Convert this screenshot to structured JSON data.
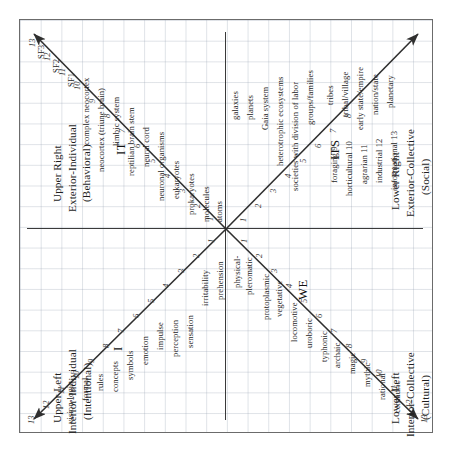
{
  "diagram": {
    "axis": {
      "vertical": "vertical-axis",
      "horizontal": "horizontal-axis"
    },
    "colors": {
      "grid": "#96a2b2",
      "frame": "#6b6b6b",
      "axis": "#3a3a3a",
      "arrow": "#2f2f2f",
      "text": "#262626"
    }
  },
  "quadrants": {
    "upper_right": {
      "title": "Upper Right",
      "subtitle": "Exterior-Individual",
      "parenthetical": "(Behavioral)",
      "pronoun": "IT",
      "numbers": [
        "1",
        "2",
        "3",
        "4",
        "5",
        "6",
        "7",
        "8",
        "9",
        "10",
        "11",
        "12",
        "13"
      ],
      "labels": [
        "atoms",
        "molecules",
        "prokaryotes",
        "eukaryotes",
        "neuronal organisms",
        "neural cord",
        "reptilian brain stem",
        "limbic system",
        "neocortex (triune brain)",
        "complex neocortex",
        "SF1",
        "SF2",
        "SF3"
      ]
    },
    "upper_left": {
      "title": "Upper Left",
      "subtitle": "Interior-Individual",
      "parenthetical": "(Intentional)",
      "pronoun": "I",
      "numbers": [
        "1",
        "2",
        "3",
        "4",
        "5",
        "6",
        "7",
        "8",
        "9",
        "10",
        "11",
        "12",
        "13"
      ],
      "labels": [
        "prehension",
        "irritability",
        "sensation",
        "perception",
        "impulse",
        "emotion",
        "symbols",
        "concepts",
        "rules",
        "formal",
        "vision-logic"
      ]
    },
    "lower_right": {
      "title": "Lower Right",
      "subtitle": "Exterior-Collective",
      "parenthetical": "(Social)",
      "pronoun": "ITS",
      "numbers": [
        "1",
        "2",
        "3",
        "4",
        "5",
        "6",
        "7",
        "8",
        "9",
        "10",
        "11",
        "12",
        "13"
      ],
      "labels": [
        "galaxies",
        "planets",
        "Gaia system",
        "heterotrophic ecosystems",
        "societies with division of labor",
        "groups/families",
        "tribes",
        "foraging 9",
        "horticultural 10",
        "tribal/village",
        "agrarian 11",
        "early state/empire",
        "industrial 12",
        "nation/state",
        "informational 13",
        "planetary"
      ]
    },
    "lower_left": {
      "title": "Lower Left",
      "subtitle": "Interior-Collective",
      "parenthetical": "(Cultural)",
      "pronoun": "WE",
      "numbers": [
        "1",
        "2",
        "3",
        "4",
        "5",
        "6",
        "7",
        "8",
        "9",
        "10",
        "11",
        "12",
        "13"
      ],
      "labels": [
        "physical-",
        "pleromatic",
        "protoplasmic",
        "vegetative",
        "locomotive",
        "uroboric",
        "typhonic",
        "archaic",
        "magic",
        "mythic",
        "rational",
        "centauric"
      ]
    }
  },
  "ur_items": [
    {
      "n": "1",
      "label": "atoms"
    },
    {
      "n": "2",
      "label": "molecules"
    },
    {
      "n": "3",
      "label": "prokaryotes"
    },
    {
      "n": "4",
      "label": "eukaryotes"
    },
    {
      "n": "5",
      "label": "neuronal organisms"
    },
    {
      "n": "6",
      "label": "neural cord"
    },
    {
      "n": "7",
      "label": "reptilian brain stem"
    },
    {
      "n": "8",
      "label": "limbic system"
    },
    {
      "n": "9",
      "label": "neocortex (triune brain)"
    },
    {
      "n": "10",
      "label": "complex neocortex"
    },
    {
      "n": "11",
      "label": "SF1"
    },
    {
      "n": "12",
      "label": "SF2"
    },
    {
      "n": "13",
      "label": "SF3"
    }
  ],
  "ul_items": [
    {
      "n": "1",
      "label": "prehension"
    },
    {
      "n": "2",
      "label": "irritability"
    },
    {
      "n": "3",
      "label": "sensation"
    },
    {
      "n": "4",
      "label": "perception"
    },
    {
      "n": "5",
      "label": "impulse"
    },
    {
      "n": "6",
      "label": "emotion"
    },
    {
      "n": "7",
      "label": "symbols"
    },
    {
      "n": "8",
      "label": "concepts"
    },
    {
      "n": "9",
      "label": "rules"
    },
    {
      "n": "10",
      "label": "formal"
    },
    {
      "n": "11",
      "label": "vision-logic"
    }
  ],
  "lr_items": [
    {
      "n": "1",
      "label": "galaxies"
    },
    {
      "n": "2",
      "label": "planets"
    },
    {
      "n": "3",
      "label": "Gaia system"
    },
    {
      "n": "4",
      "label": "heterotrophic ecosystems"
    },
    {
      "n": "5",
      "label": "societies with division of labor"
    },
    {
      "n": "6",
      "label": "groups/families"
    },
    {
      "n": "7",
      "label": "tribes"
    },
    {
      "n": "8",
      "label": "tribal/village"
    },
    {
      "n": "9",
      "label": "early state/empire"
    },
    {
      "n": "10",
      "label": "nation/state"
    },
    {
      "n": "11",
      "label": "planetary"
    }
  ],
  "lr_stage_items": [
    {
      "label": "foraging 9"
    },
    {
      "label": "horticultural 10"
    },
    {
      "label": "agrarian 11"
    },
    {
      "label": "industrial 12"
    },
    {
      "label": "informational 13"
    }
  ],
  "ll_items": [
    {
      "n": "1",
      "label": "physical-"
    },
    {
      "n": "1b",
      "label": "pleromatic"
    },
    {
      "n": "2",
      "label": "protoplasmic"
    },
    {
      "n": "3",
      "label": "vegetative"
    },
    {
      "n": "4",
      "label": "locomotive"
    },
    {
      "n": "5",
      "label": "uroboric"
    },
    {
      "n": "6",
      "label": "typhonic"
    },
    {
      "n": "7",
      "label": "archaic"
    },
    {
      "n": "8",
      "label": "magic"
    },
    {
      "n": "9",
      "label": "mythic"
    },
    {
      "n": "10",
      "label": "rational"
    },
    {
      "n": "11",
      "label": "centauric"
    }
  ]
}
